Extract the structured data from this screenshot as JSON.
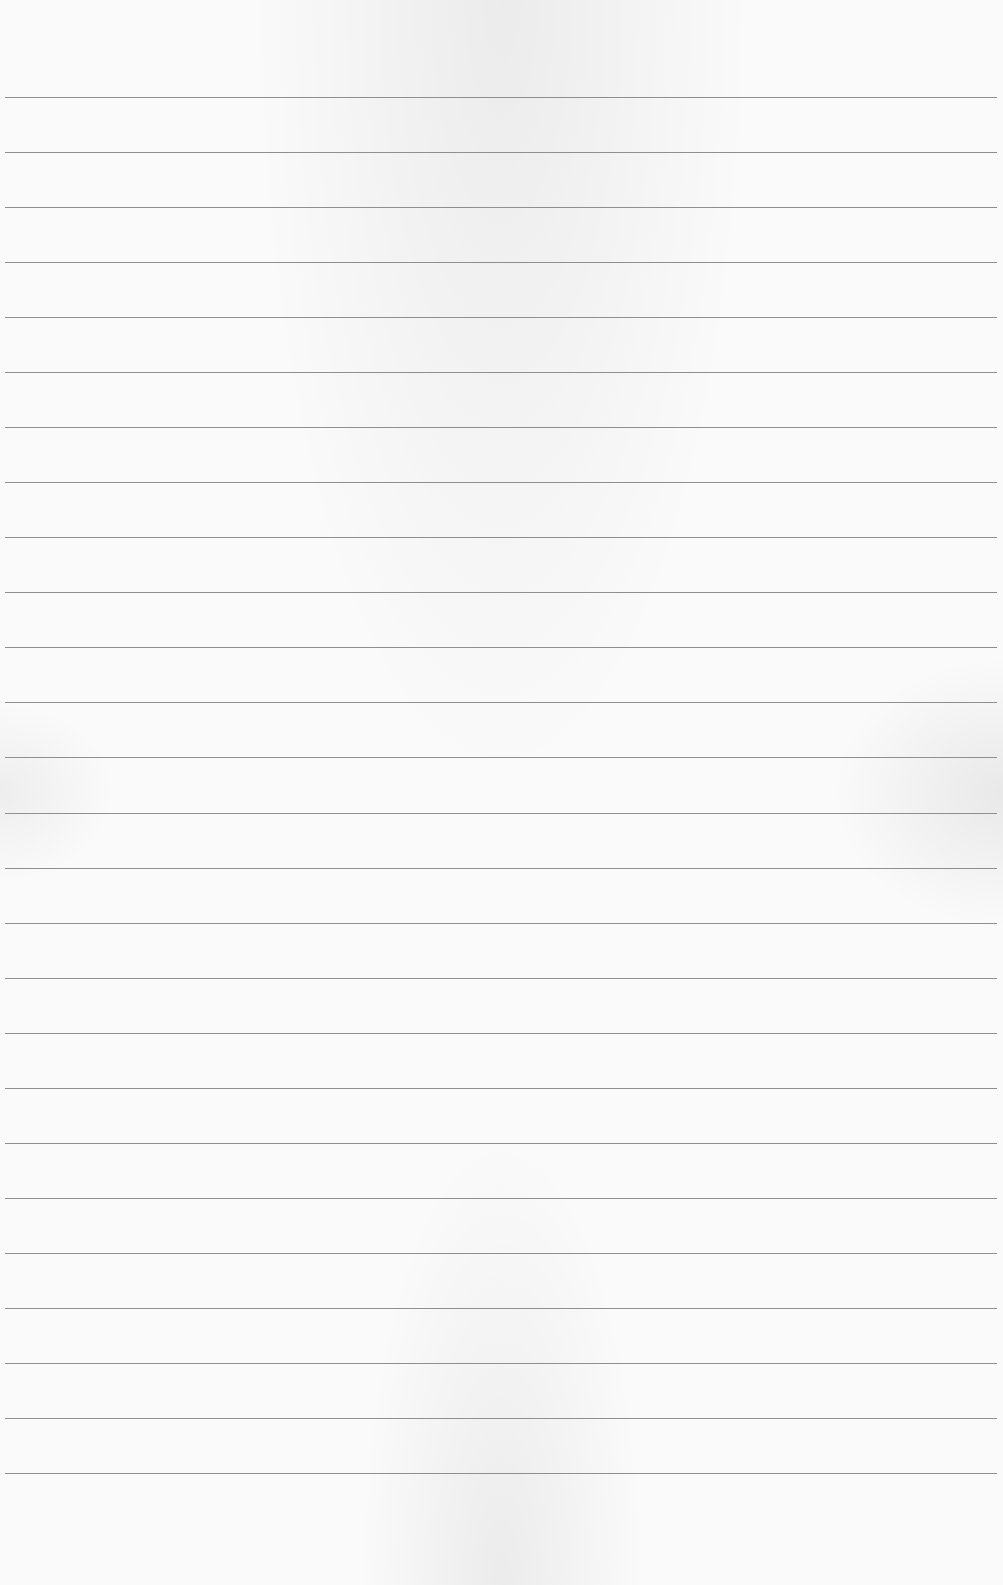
{
  "paper": {
    "type": "lined",
    "background_color": "#fafafa",
    "line_color": "#8f8f8f",
    "line_count": 26,
    "first_line_y": 97,
    "line_spacing": 55.04,
    "line_left": 5,
    "line_right_inset": 6
  },
  "content": {
    "text": ""
  }
}
